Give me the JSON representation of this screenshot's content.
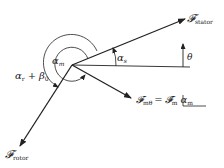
{
  "diagram": {
    "type": "phasor-diagram",
    "colors": {
      "stroke": "#222222",
      "background": "#ffffff"
    },
    "vectors": {
      "stator": {
        "symbol": "𝓕",
        "subscript": "stator"
      },
      "rotor": {
        "symbol": "𝓕",
        "subscript": "rotor"
      },
      "resultant": {
        "symbol": "𝓕",
        "subscript": "mθ",
        "equation_rhs_symbol": "𝓕̂",
        "equation_rhs_subscript": "m",
        "equals": "=",
        "angle_symbol": "α",
        "angle_subscript": "m"
      }
    },
    "angles": {
      "alpha_s": {
        "symbol": "α",
        "subscript": "s"
      },
      "alpha_m": {
        "symbol": "α",
        "subscript": "m"
      },
      "alpha_r_beta0": {
        "symbol1": "α",
        "subscript1": "r",
        "plus": "+",
        "symbol2": "β",
        "subscript2": "0"
      },
      "theta": {
        "symbol": "θ"
      }
    }
  }
}
